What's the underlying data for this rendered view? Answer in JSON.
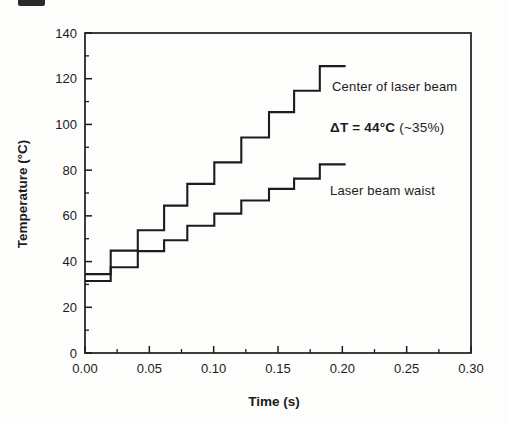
{
  "figure": {
    "background": "#fdfdfc",
    "ink_color": "#1c1c1c",
    "frame": {
      "left": 85,
      "right": 471,
      "top": 33,
      "bottom": 353
    }
  },
  "chart_data": {
    "type": "line",
    "subtype": "step-staircase",
    "title": "",
    "xlabel": "Time (s)",
    "ylabel": "Temperature (°C)",
    "xlim": [
      0,
      0.3
    ],
    "ylim": [
      0,
      140
    ],
    "grid": false,
    "legend": "direct-labels-on-plot",
    "x_major_ticks": [
      0.0,
      0.05,
      0.1,
      0.15,
      0.2,
      0.25,
      0.3
    ],
    "x_tick_labels": [
      "0.00",
      "0.05",
      "0.10",
      "0.15",
      "0.20",
      "0.25",
      "0.30"
    ],
    "x_minor_ticks": [
      0.025,
      0.075,
      0.125,
      0.175,
      0.225,
      0.275
    ],
    "y_major_ticks": [
      0,
      20,
      40,
      60,
      80,
      100,
      120,
      140
    ],
    "y_tick_labels": [
      "0",
      "20",
      "40",
      "60",
      "80",
      "100",
      "120",
      "140"
    ],
    "y_minor_ticks": [
      10,
      30,
      50,
      70,
      90,
      110,
      130
    ],
    "step_times": [
      0.02,
      0.041,
      0.0615,
      0.0795,
      0.1005,
      0.1215,
      0.143,
      0.1625,
      0.1825
    ],
    "end_time": 0.2025,
    "series": [
      {
        "name": "Center of laser beam",
        "levels": [
          34.5,
          44.8,
          53.7,
          64.5,
          74.0,
          83.4,
          94.3,
          105.4,
          114.7,
          125.5
        ]
      },
      {
        "name": "Laser beam waist",
        "levels": [
          31.5,
          37.5,
          44.6,
          49.3,
          55.7,
          61.0,
          66.7,
          71.8,
          76.3,
          82.5
        ]
      }
    ],
    "annotations": {
      "center_label": "Center of laser beam",
      "delta_bold": "ΔT = 44°C",
      "delta_rest": " (~35%)",
      "waist_label": "Laser beam waist"
    }
  }
}
